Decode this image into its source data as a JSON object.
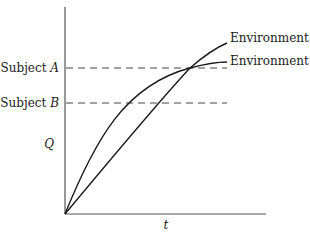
{
  "diagram": {
    "axes": {
      "y_label": "Q",
      "x_label": "t"
    },
    "levels": [
      {
        "prefix": "Subject ",
        "name": "A",
        "y": 68
      },
      {
        "prefix": "Subject ",
        "name": "B",
        "y": 103
      }
    ],
    "curves": [
      {
        "label": "Environment 1",
        "shape": "nearly linear, steeper at end"
      },
      {
        "label": "Environment 2",
        "shape": "concave, saturating"
      }
    ],
    "colors": {
      "line": "#1a1a1a",
      "axis": "#555555",
      "dash": "#444444"
    }
  }
}
